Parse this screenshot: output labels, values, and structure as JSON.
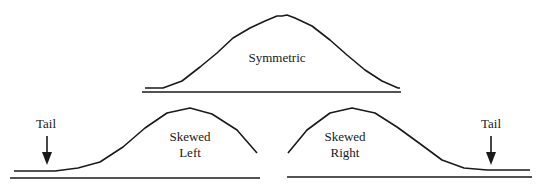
{
  "diagram": {
    "type": "distribution-shapes",
    "panels": [
      {
        "id": "symmetric",
        "label": "Symmetric"
      },
      {
        "id": "skewed-left",
        "label_line1": "Skewed",
        "label_line2": "Left",
        "tail_label": "Tail"
      },
      {
        "id": "skewed-right",
        "label_line1": "Skewed",
        "label_line2": "Right",
        "tail_label": "Tail"
      }
    ],
    "colors": {
      "stroke": "#1a1a1a",
      "background": "#ffffff"
    }
  }
}
